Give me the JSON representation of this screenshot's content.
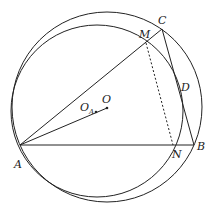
{
  "diagram": {
    "type": "geometry",
    "stroke_color": "#222222",
    "background": "#ffffff",
    "points": {
      "A": {
        "x": 20,
        "y": 145,
        "label": "A"
      },
      "B": {
        "x": 194,
        "y": 145,
        "label": "B"
      },
      "C": {
        "x": 162,
        "y": 29,
        "label": "C"
      },
      "M": {
        "x": 146,
        "y": 43,
        "label": "M"
      },
      "N": {
        "x": 173,
        "y": 145,
        "label": "N"
      },
      "D": {
        "x": 180,
        "y": 92,
        "label": "D"
      },
      "O": {
        "x": 107,
        "y": 108,
        "label": "O"
      },
      "OA": {
        "x": 96,
        "y": 112,
        "label": "O",
        "subscript": "A"
      }
    },
    "circles": [
      {
        "name": "circumcircle-O",
        "cx": 107,
        "cy": 107,
        "r": 95
      },
      {
        "name": "circle-OA",
        "cx": 97,
        "cy": 111,
        "r": 86
      }
    ],
    "segments": [
      {
        "from": "A",
        "to": "B",
        "style": "solid"
      },
      {
        "from": "A",
        "to": "C",
        "style": "solid"
      },
      {
        "from": "C",
        "to": "B",
        "style": "solid"
      },
      {
        "from": "A",
        "to": "O",
        "style": "solid"
      },
      {
        "from": "M",
        "to": "N",
        "style": "dashed"
      }
    ]
  }
}
